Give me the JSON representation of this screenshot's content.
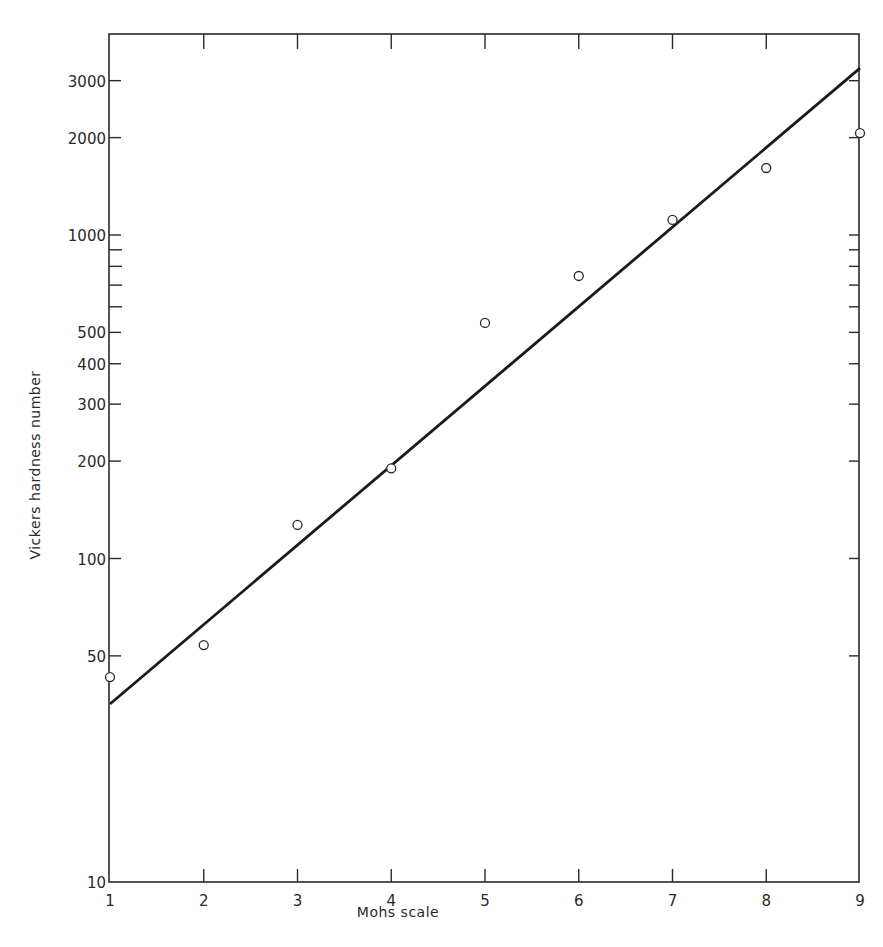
{
  "chart_data": {
    "type": "scatter",
    "title": "",
    "xlabel": "Mohs scale",
    "ylabel": "Vickers hardness number",
    "x_scale": "linear",
    "y_scale": "log",
    "xlim": [
      1,
      9
    ],
    "ylim": [
      10,
      5000
    ],
    "grid": false,
    "legend": null,
    "x_ticks": [
      1,
      2,
      3,
      4,
      5,
      6,
      7,
      8,
      9
    ],
    "x_tick_labels": [
      "1",
      "2",
      "3",
      "4",
      "5",
      "6",
      "7",
      "8",
      "9"
    ],
    "y_ticks_labeled": [
      10,
      50,
      100,
      200,
      300,
      400,
      500,
      1000,
      2000,
      3000
    ],
    "y_tick_labels": [
      "10",
      "50",
      "100",
      "200",
      "300",
      "400",
      "500",
      "1000",
      "2000",
      "3000"
    ],
    "y_ticks_minor": [
      600,
      700,
      800,
      900
    ],
    "series": [
      {
        "name": "Minerals (measured)",
        "marker": "open-circle",
        "x": [
          1,
          2,
          3,
          4,
          5,
          6,
          7,
          8,
          9
        ],
        "values": [
          43,
          54,
          127,
          190,
          535,
          747,
          1113,
          1611,
          2066
        ]
      },
      {
        "name": "Fitted line",
        "style": "solid-line",
        "x": [
          1,
          9
        ],
        "values": [
          35.5,
          3280
        ]
      }
    ]
  },
  "axes": {
    "xlabel": "Mohs scale",
    "ylabel": "Vickers hardness number"
  }
}
